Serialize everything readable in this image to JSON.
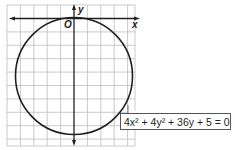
{
  "diagram": {
    "type": "coordinate-graph",
    "axes": {
      "x_label": "x",
      "y_label": "y",
      "origin_label": "O"
    },
    "grid": {
      "visible": true,
      "color": "#b9b9b9"
    },
    "curve": {
      "kind": "circle",
      "equation_label": "4x² + 4y² + 36y + 5 = 0",
      "center": [
        0,
        -4.5
      ],
      "radius": 4.36
    },
    "colors": {
      "axis": "#231f20",
      "curve": "#231f20",
      "grid": "#b9b9b9"
    }
  }
}
